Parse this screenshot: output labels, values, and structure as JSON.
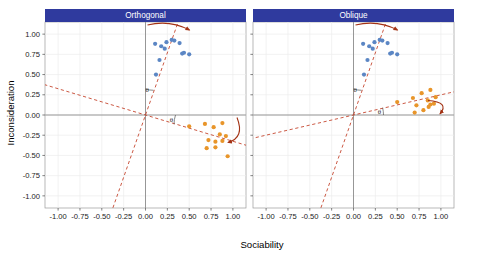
{
  "chart_data": {
    "type": "scatter",
    "title": "",
    "xlabel": "Sociability",
    "ylabel": "Inconsideration",
    "xlim": [
      -1.15,
      1.15
    ],
    "ylim": [
      -1.15,
      1.15
    ],
    "xticks": [
      -1.0,
      -0.75,
      -0.5,
      -0.25,
      0.0,
      0.25,
      0.5,
      0.75,
      1.0
    ],
    "xticklabels": [
      "-1.00",
      "-0.75",
      "-0.50",
      "-0.25",
      "0.00",
      "0.25",
      "0.50",
      "0.75",
      "1.00"
    ],
    "yticks": [
      -1.0,
      -0.75,
      -0.5,
      -0.25,
      0.0,
      0.25,
      0.5,
      0.75,
      1.0
    ],
    "yticklabels": [
      "-1.00",
      "-0.75",
      "-0.50",
      "-0.25",
      "0.00",
      "0.25",
      "0.50",
      "0.75",
      "1.00"
    ],
    "grid": true,
    "legend": "none",
    "facets": [
      {
        "label": "Orthogonal",
        "annotation_symbol": "θ",
        "axis_lines": [
          {
            "name": "factor-axis-1",
            "angle_deg": 72,
            "style": "dashed",
            "color": "#c23b22"
          },
          {
            "name": "factor-axis-2",
            "angle_deg": -18,
            "style": "dashed",
            "color": "#c23b22"
          }
        ],
        "series": [
          {
            "name": "blue-cluster",
            "color": "#5b86c4",
            "points": [
              [
                0.11,
                0.88
              ],
              [
                0.18,
                0.85
              ],
              [
                0.24,
                0.9
              ],
              [
                0.3,
                0.93
              ],
              [
                0.33,
                0.92
              ],
              [
                0.39,
                0.89
              ],
              [
                0.42,
                0.76
              ],
              [
                0.44,
                0.77
              ],
              [
                0.5,
                0.75
              ],
              [
                0.22,
                0.82
              ],
              [
                0.16,
                0.68
              ],
              [
                0.12,
                0.5
              ]
            ]
          },
          {
            "name": "orange-cluster",
            "color": "#e8952a",
            "points": [
              [
                0.5,
                -0.14
              ],
              [
                0.68,
                -0.11
              ],
              [
                0.78,
                -0.15
              ],
              [
                0.88,
                -0.1
              ],
              [
                0.85,
                -0.24
              ],
              [
                0.92,
                -0.26
              ],
              [
                0.72,
                -0.31
              ],
              [
                0.8,
                -0.33
              ],
              [
                0.88,
                -0.32
              ],
              [
                0.7,
                -0.41
              ],
              [
                0.8,
                -0.4
              ],
              [
                0.94,
                -0.51
              ]
            ]
          }
        ],
        "curved_arrows": [
          {
            "name": "rotation-arrow-top",
            "color": "#a33214"
          },
          {
            "name": "rotation-arrow-right",
            "color": "#a33214"
          }
        ]
      },
      {
        "label": "Oblique",
        "annotation_symbol": "θ",
        "axis_lines": [
          {
            "name": "factor-axis-1",
            "angle_deg": 72,
            "style": "dashed",
            "color": "#c23b22"
          },
          {
            "name": "factor-axis-2",
            "angle_deg": 14,
            "style": "dashed",
            "color": "#c23b22"
          }
        ],
        "series": [
          {
            "name": "blue-cluster",
            "color": "#5b86c4",
            "points": [
              [
                0.11,
                0.88
              ],
              [
                0.18,
                0.85
              ],
              [
                0.24,
                0.9
              ],
              [
                0.3,
                0.93
              ],
              [
                0.33,
                0.92
              ],
              [
                0.39,
                0.89
              ],
              [
                0.42,
                0.76
              ],
              [
                0.44,
                0.77
              ],
              [
                0.5,
                0.75
              ],
              [
                0.22,
                0.82
              ],
              [
                0.16,
                0.68
              ],
              [
                0.12,
                0.5
              ]
            ]
          },
          {
            "name": "orange-cluster",
            "color": "#e8952a",
            "points": [
              [
                0.5,
                0.16
              ],
              [
                0.68,
                0.21
              ],
              [
                0.78,
                0.27
              ],
              [
                0.88,
                0.31
              ],
              [
                0.85,
                0.18
              ],
              [
                0.92,
                0.14
              ],
              [
                0.72,
                0.12
              ],
              [
                0.86,
                0.1
              ],
              [
                0.88,
                0.13
              ],
              [
                0.7,
                0.03
              ],
              [
                0.8,
                0.06
              ],
              [
                0.94,
                0.22
              ]
            ]
          }
        ],
        "curved_arrows": [
          {
            "name": "rotation-arrow-top",
            "color": "#a33214"
          },
          {
            "name": "rotation-arrow-right",
            "color": "#a33214"
          }
        ]
      }
    ],
    "colors": {
      "facet_header_bg": "#2f3a9e",
      "facet_header_text": "#ffffff",
      "blue_points": "#5b86c4",
      "orange_points": "#e8952a",
      "axis_line": "#c23b22",
      "arrow": "#a33214",
      "zero_line": "#8c8c8c",
      "grid": "#ececec",
      "panel_border": "#9a9a9a",
      "background": "#ffffff"
    }
  }
}
